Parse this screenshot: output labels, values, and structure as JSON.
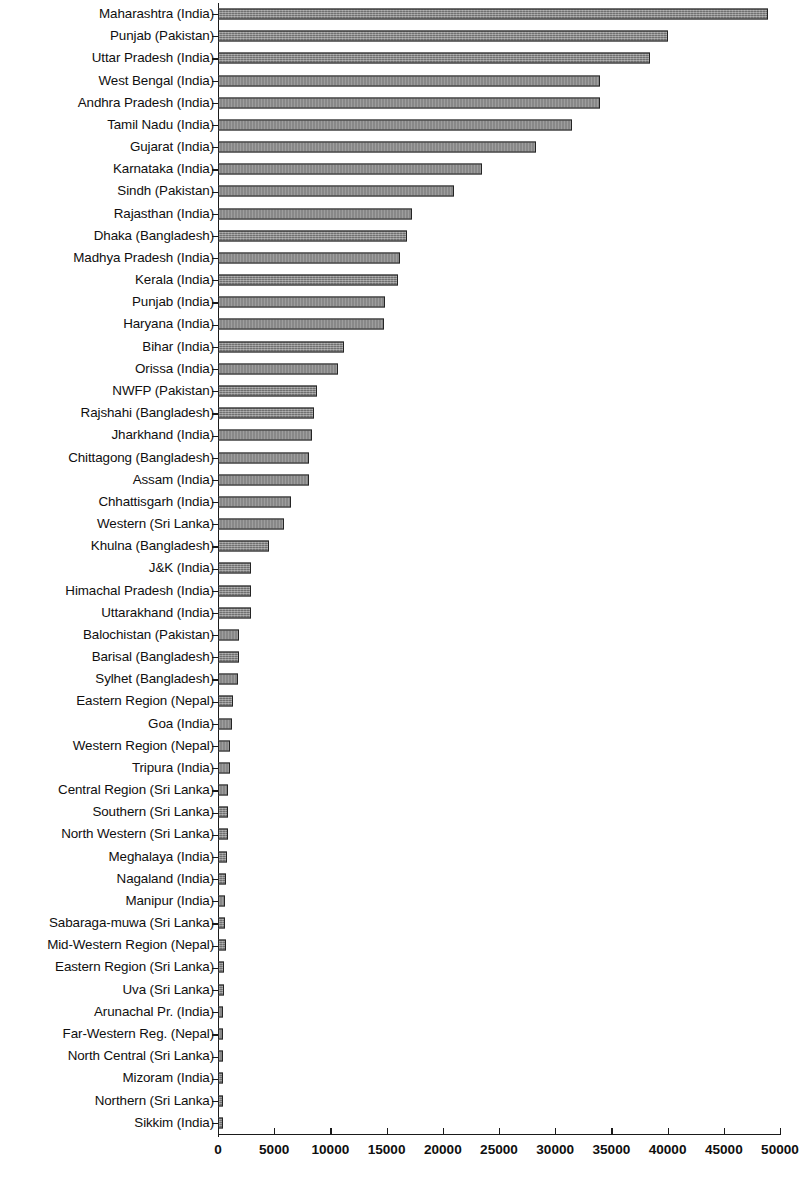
{
  "chart_data": {
    "type": "bar",
    "orientation": "horizontal",
    "title": "",
    "subtitle": "",
    "xlabel": "",
    "ylabel": "",
    "xlim": [
      0,
      50000
    ],
    "xticks": [
      0,
      5000,
      10000,
      15000,
      20000,
      25000,
      30000,
      35000,
      40000,
      45000,
      50000
    ],
    "xtick_labels": [
      "0",
      "5000",
      "10000",
      "15000",
      "20000",
      "25000",
      "30000",
      "35000",
      "40000",
      "45000",
      "50000"
    ],
    "grid": false,
    "legend": null,
    "bar_color": "#7d7d7d",
    "bar_edge_color": "#242424",
    "categories": [
      "Maharashtra (India)",
      "Punjab (Pakistan)",
      "Uttar Pradesh (India)",
      "West Bengal (India)",
      "Andhra Pradesh (India)",
      "Tamil Nadu (India)",
      "Gujarat (India)",
      "Karnataka (India)",
      "Sindh (Pakistan)",
      "Rajasthan (India)",
      "Dhaka (Bangladesh)",
      "Madhya Pradesh (India)",
      "Kerala (India)",
      "Punjab (India)",
      "Haryana (India)",
      "Bihar (India)",
      "Orissa (India)",
      "NWFP (Pakistan)",
      "Rajshahi (Bangladesh)",
      "Jharkhand (India)",
      "Chittagong (Bangladesh)",
      "Assam (India)",
      "Chhattisgarh (India)",
      "Western (Sri Lanka)",
      "Khulna (Bangladesh)",
      "J&K (India)",
      "Himachal Pradesh (India)",
      "Uttarakhand (India)",
      "Balochistan (Pakistan)",
      "Barisal (Bangladesh)",
      "Sylhet (Bangladesh)",
      "Eastern Region (Nepal)",
      "Goa (India)",
      "Western Region (Nepal)",
      "Tripura (India)",
      "Central Region (Sri Lanka)",
      "Southern (Sri Lanka)",
      "North Western (Sri Lanka)",
      "Meghalaya (India)",
      "Nagaland (India)",
      "Manipur (India)",
      "Sabaraga-muwa (Sri Lanka)",
      "Mid-Western Region (Nepal)",
      "Eastern Region (Sri Lanka)",
      "Uva (Sri Lanka)",
      "Arunachal Pr. (India)",
      "Far-Western Reg. (Nepal)",
      "North Central (Sri Lanka)",
      "Mizoram (India)",
      "Northern (Sri Lanka)",
      "Sikkim (India)"
    ],
    "values": [
      48900,
      40000,
      38400,
      34000,
      34000,
      31500,
      28300,
      23500,
      21000,
      17300,
      16800,
      16200,
      16000,
      14900,
      14800,
      11200,
      10700,
      8800,
      8500,
      8400,
      8100,
      8100,
      6500,
      5900,
      4500,
      2900,
      2900,
      2900,
      1900,
      1850,
      1800,
      1300,
      1250,
      1100,
      1100,
      900,
      870,
      850,
      800,
      700,
      650,
      620,
      700,
      520,
      500,
      470,
      460,
      450,
      420,
      400,
      380
    ]
  }
}
